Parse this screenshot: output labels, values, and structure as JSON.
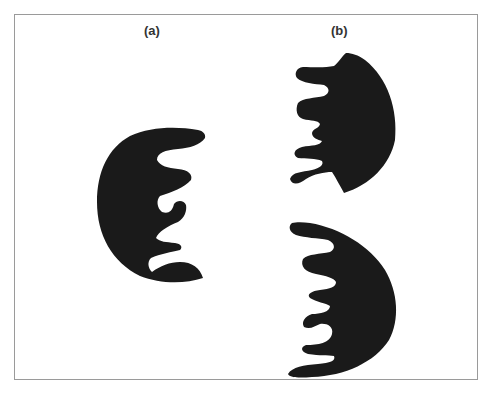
{
  "figure": {
    "panels": [
      {
        "id": "a",
        "label": "(a)",
        "shapes": [
          "comb-shape-a"
        ]
      },
      {
        "id": "b",
        "label": "(b)",
        "shapes": [
          "comb-shape-b-top",
          "comb-shape-b-bottom"
        ]
      }
    ],
    "colors": {
      "shape_fill": "#1a1a1a",
      "frame_border": "#9a9a9a",
      "background": "#ffffff",
      "label_text": "#333333"
    }
  }
}
